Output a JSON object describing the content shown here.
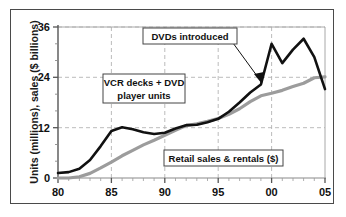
{
  "chart_data": {
    "type": "line",
    "title": "",
    "xlabel": "",
    "ylabel": "Units (millions), sales ($ billions)",
    "xlim": [
      80,
      105
    ],
    "ylim": [
      0,
      36
    ],
    "xticks": [
      "80",
      "85",
      "90",
      "95",
      "00",
      "05"
    ],
    "xtick_values": [
      80,
      85,
      90,
      95,
      100,
      105
    ],
    "yticks": [
      "0",
      "12",
      "24",
      "36"
    ],
    "ytick_values": [
      0,
      12,
      24,
      36
    ],
    "grid": true,
    "grid_style": "dashed",
    "legend": "none",
    "x": [
      80,
      81,
      82,
      83,
      84,
      85,
      86,
      87,
      88,
      89,
      90,
      91,
      92,
      93,
      94,
      95,
      96,
      97,
      98,
      99,
      100,
      101,
      102,
      103,
      104,
      105
    ],
    "series": [
      {
        "name": "VCR decks + DVD player units",
        "color": "#111111",
        "values": [
          1.2,
          1.4,
          2.2,
          4.3,
          7.6,
          11.2,
          12.1,
          11.6,
          10.9,
          10.5,
          10.8,
          11.8,
          12.6,
          12.7,
          13.3,
          14.1,
          15.8,
          18.0,
          20.4,
          22.3,
          32.0,
          27.4,
          30.6,
          33.2,
          28.8,
          21.2
        ]
      },
      {
        "name": "Retail sales & rentals ($)",
        "color": "#9c9c9c",
        "values": [
          0,
          0,
          0.3,
          1.1,
          2.4,
          3.8,
          5.3,
          6.6,
          7.9,
          9.0,
          10.2,
          11.4,
          12.5,
          12.9,
          13.5,
          14.2,
          15.2,
          16.5,
          18.2,
          19.6,
          20.2,
          20.9,
          21.8,
          22.6,
          23.9,
          24.1
        ]
      }
    ],
    "annotations": [
      {
        "id": "dvds-introduced",
        "text": "DVDs introduced",
        "lines": [
          "DVDs introduced"
        ],
        "points_to_x": 99,
        "points_to_y": 23.5,
        "boxed": true
      },
      {
        "id": "vcr-dvd-units",
        "text": "VCR decks + DVD player units",
        "lines": [
          "VCR decks + DVD",
          "player units"
        ],
        "boxed": true
      },
      {
        "id": "retail-sales-rentals",
        "text": "Retail sales & rentals ($)",
        "lines": [
          "Retail sales & rentals ($)"
        ],
        "boxed": true
      }
    ]
  },
  "colors": {
    "series_dark": "#111111",
    "series_light": "#9c9c9c",
    "frame": "#4a4a4a",
    "grid": "#b4b4b4",
    "axis": "#8a8a8a",
    "text": "#111111",
    "background": "#ffffff"
  }
}
